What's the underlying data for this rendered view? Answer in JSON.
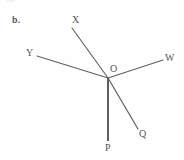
{
  "figure": {
    "part_label": "b.",
    "background_color": "#fefefe",
    "stroke_color": "#5f5f5f",
    "label_color": "#555555",
    "vertex": {
      "name": "O",
      "label": "O",
      "x": 108,
      "y": 78
    },
    "rays": [
      {
        "name": "ray-OX",
        "endpoint_label": "X",
        "from_x": 108,
        "from_y": 78,
        "to_x": 72,
        "to_y": 28,
        "width": 1.1
      },
      {
        "name": "ray-OY",
        "endpoint_label": "Y",
        "from_x": 108,
        "from_y": 78,
        "to_x": 37,
        "to_y": 56,
        "width": 1.1
      },
      {
        "name": "ray-OW",
        "endpoint_label": "W",
        "from_x": 108,
        "from_y": 78,
        "to_x": 163,
        "to_y": 60,
        "width": 1.1
      },
      {
        "name": "ray-OQ",
        "endpoint_label": "Q",
        "from_x": 108,
        "from_y": 78,
        "to_x": 138,
        "to_y": 129,
        "width": 1.2
      },
      {
        "name": "ray-OP",
        "endpoint_label": "P",
        "from_x": 108,
        "from_y": 78,
        "to_x": 108,
        "to_y": 141,
        "width": 2.0
      }
    ],
    "point_labels": [
      {
        "name": "label-X",
        "text": "X",
        "x": 72,
        "y": 15
      },
      {
        "name": "label-Y",
        "text": "Y",
        "x": 26,
        "y": 48
      },
      {
        "name": "label-W",
        "text": "W",
        "x": 165,
        "y": 53
      },
      {
        "name": "label-O",
        "text": "O",
        "x": 110,
        "y": 64
      },
      {
        "name": "label-Q",
        "text": "Q",
        "x": 139,
        "y": 129
      },
      {
        "name": "label-P",
        "text": "P",
        "x": 105,
        "y": 143
      }
    ]
  }
}
